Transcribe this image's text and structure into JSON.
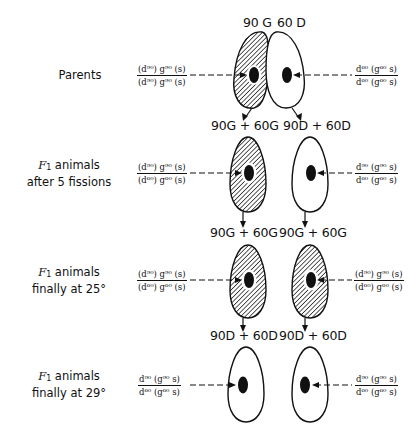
{
  "rows": [
    {
      "label_line1": "Parents",
      "label_line2": "",
      "left_cell_label": "90 G",
      "right_cell_label": "60 D",
      "left_formula": {
        "num": "(d⁹⁰) g⁹⁰ (s)",
        "den": "(d⁹⁰) g⁹⁰ (s)"
      },
      "right_formula": {
        "num": "d⁶⁰ (g⁶⁰ s)",
        "den": "d⁶⁰ (g⁶⁰ s)"
      },
      "left_cell_shaded": true,
      "right_cell_shaded": false
    },
    {
      "label_prefix": "F",
      "label_sub": "1",
      "label_line1": " animals",
      "label_line2": "after 5 fissions",
      "left_cell_label": "90G + 60G",
      "right_cell_label": "90D + 60D",
      "left_formula": {
        "num": "(d⁹⁰) g⁹⁰ (s)",
        "den": "(d⁶⁰) g⁶⁰ (s)"
      },
      "right_formula": {
        "num": "d⁹⁰ (g⁹⁰ s)",
        "den": "d⁶⁰ (g⁶⁰ s)"
      },
      "left_cell_shaded": true,
      "right_cell_shaded": false
    },
    {
      "label_prefix": "F",
      "label_sub": "1",
      "label_line1": " animals",
      "label_line2": "finally at 25°",
      "left_cell_label": "90G + 60G",
      "right_cell_label": "90G + 60G",
      "left_formula": {
        "num": "(d⁹⁰) g⁹⁰ (s)",
        "den": "(d⁶⁰) g⁶⁰ (s)"
      },
      "right_formula": {
        "num": "(d⁹⁰) g⁹⁰ (s)",
        "den": "(d⁶⁰) g⁶⁰ (s)"
      },
      "left_cell_shaded": true,
      "right_cell_shaded": true
    },
    {
      "label_prefix": "F",
      "label_sub": "1",
      "label_line1": " animals",
      "label_line2": "finally at 29°",
      "left_cell_label": "90D + 60D",
      "right_cell_label": "90D + 60D",
      "left_formula": {
        "num": "d⁹⁰ (g⁹⁰ s)",
        "den": "d⁶⁰ (g⁶⁰ s)"
      },
      "right_formula": {
        "num": "d⁹⁰ (g⁹⁰ s)",
        "den": "d⁶⁰ (g⁶⁰ s)"
      },
      "left_cell_shaded": false,
      "right_cell_shaded": false
    }
  ],
  "colors": {
    "ink": "#111111",
    "background": "#ffffff"
  }
}
